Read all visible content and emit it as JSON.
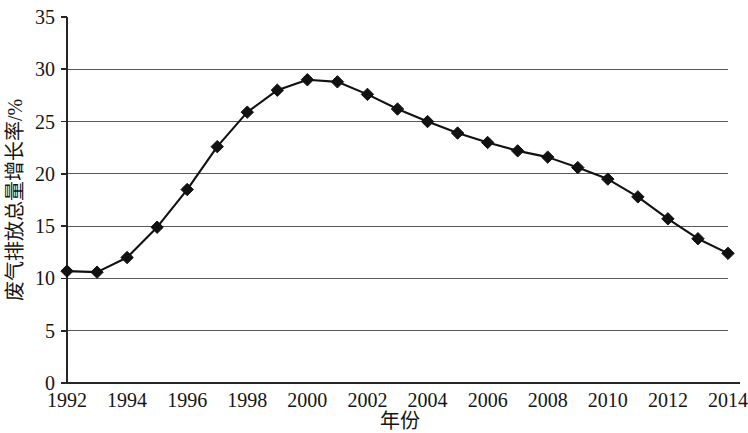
{
  "chart_data": {
    "type": "line",
    "title": "",
    "xlabel": "年份",
    "ylabel": "废气排放总量增长率/%",
    "xlim": [
      1992,
      2014
    ],
    "ylim": [
      0,
      35
    ],
    "grid": true,
    "legend": false,
    "legend_position": "none",
    "marker": "diamond",
    "line_color": "#111111",
    "marker_color": "#111111",
    "grid_color": "#595959",
    "x_tick_labels": [
      "1992",
      "1994",
      "1996",
      "1998",
      "2000",
      "2002",
      "2004",
      "2006",
      "2008",
      "2010",
      "2012",
      "2014"
    ],
    "x_tick_values": [
      1992,
      1994,
      1996,
      1998,
      2000,
      2002,
      2004,
      2006,
      2008,
      2010,
      2012,
      2014
    ],
    "y_tick_labels": [
      "0",
      "5",
      "10",
      "15",
      "20",
      "25",
      "30",
      "35"
    ],
    "y_tick_values": [
      0,
      5,
      10,
      15,
      20,
      25,
      30,
      35
    ],
    "x": [
      1992,
      1993,
      1994,
      1995,
      1996,
      1997,
      1998,
      1999,
      2000,
      2001,
      2002,
      2003,
      2004,
      2005,
      2006,
      2007,
      2008,
      2009,
      2010,
      2011,
      2012,
      2013,
      2014
    ],
    "values": [
      10.7,
      10.6,
      12.0,
      14.9,
      18.5,
      22.6,
      25.9,
      28.0,
      29.0,
      28.8,
      27.6,
      26.2,
      25.0,
      23.9,
      23.0,
      22.2,
      21.6,
      20.6,
      19.5,
      17.8,
      15.7,
      13.8,
      12.4
    ],
    "series": [
      {
        "name": "废气排放总量增长率",
        "values": [
          10.7,
          10.6,
          12.0,
          14.9,
          18.5,
          22.6,
          25.9,
          28.0,
          29.0,
          28.8,
          27.6,
          26.2,
          25.0,
          23.9,
          23.0,
          22.2,
          21.6,
          20.6,
          19.5,
          17.8,
          15.7,
          13.8,
          12.4
        ]
      }
    ]
  }
}
